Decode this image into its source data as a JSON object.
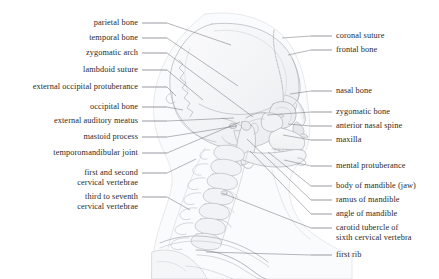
{
  "figure": {
    "background_color": "#ffffff",
    "text_color": "#2a2a2a",
    "leader_color": "#6e6e78",
    "art_stroke_color": "#b9bcc4",
    "art_fill_color": "#f4f5f7",
    "width": 439,
    "height": 279
  },
  "labels_left": [
    {
      "name": "parietal-bone",
      "lines": [
        "parietal bone"
      ],
      "text_right": 138,
      "baseline": 26,
      "dash_x1": 142,
      "dash_x2": 167,
      "lead_x": 231,
      "lead_y": 45
    },
    {
      "name": "temporal-bone",
      "lines": [
        "temporal bone"
      ],
      "text_right": 138,
      "baseline": 41,
      "dash_x1": 142,
      "dash_x2": 167,
      "lead_x": 238,
      "lead_y": 86
    },
    {
      "name": "zygomatic-arch",
      "lines": [
        "zygomatic arch"
      ],
      "text_right": 138,
      "baseline": 56,
      "dash_x1": 142,
      "dash_x2": 167,
      "lead_x": 253,
      "lead_y": 117
    },
    {
      "name": "lambdoid-suture",
      "lines": [
        "lambdoid suture"
      ],
      "text_right": 138,
      "baseline": 73,
      "dash_x1": 142,
      "dash_x2": 167,
      "lead_x": 203,
      "lead_y": 100
    },
    {
      "name": "external-occipital-protuberance",
      "lines": [
        "external occipital protuberance"
      ],
      "text_right": 138,
      "baseline": 90,
      "dash_x1": 142,
      "dash_x2": 167,
      "lead_x": 176,
      "lead_y": 96
    },
    {
      "name": "occipital-bone",
      "lines": [
        "occipital bone"
      ],
      "text_right": 138,
      "baseline": 110,
      "dash_x1": 142,
      "dash_x2": 167,
      "lead_x": 183,
      "lead_y": 110
    },
    {
      "name": "external-auditory-meatus",
      "lines": [
        "external auditory meatus"
      ],
      "text_right": 138,
      "baseline": 124,
      "dash_x1": 142,
      "dash_x2": 167,
      "lead_x": 234,
      "lead_y": 118
    },
    {
      "name": "mastoid-process",
      "lines": [
        "mastoid process"
      ],
      "text_right": 138,
      "baseline": 140,
      "dash_x1": 142,
      "dash_x2": 167,
      "lead_x": 236,
      "lead_y": 126
    },
    {
      "name": "temporomandibular-joint",
      "lines": [
        "temporomandibular joint"
      ],
      "text_right": 138,
      "baseline": 156,
      "dash_x1": 142,
      "dash_x2": 167,
      "lead_x": 240,
      "lead_y": 122
    },
    {
      "name": "first-and-second-cervical-vertebrae",
      "lines": [
        "first and second",
        "cervical vertebrae"
      ],
      "text_right": 138,
      "baseline": 176,
      "dash_x1": 142,
      "dash_x2": 167,
      "lead_x": 196,
      "lead_y": 159
    },
    {
      "name": "third-to-seventh-cervical-vertebrae",
      "lines": [
        "third to seventh",
        "cervical vertebrae"
      ],
      "text_right": 138,
      "baseline": 200,
      "dash_x1": 142,
      "dash_x2": 167,
      "lead_x": 190,
      "lead_y": 210
    }
  ],
  "labels_right": [
    {
      "name": "coronal-suture",
      "lines": [
        "coronal suture"
      ],
      "text_left": 336,
      "baseline": 39,
      "dash_x1": 311,
      "dash_x2": 332,
      "lead_x": 282,
      "lead_y": 38
    },
    {
      "name": "frontal-bone",
      "lines": [
        "frontal bone"
      ],
      "text_left": 336,
      "baseline": 53,
      "dash_x1": 311,
      "dash_x2": 332,
      "lead_x": 288,
      "lead_y": 55
    },
    {
      "name": "nasal-bone",
      "lines": [
        "nasal bone"
      ],
      "text_left": 336,
      "baseline": 94,
      "dash_x1": 311,
      "dash_x2": 332,
      "lead_x": 290,
      "lead_y": 94
    },
    {
      "name": "zygomatic-bone",
      "lines": [
        "zygomatic bone"
      ],
      "text_left": 336,
      "baseline": 115,
      "dash_x1": 311,
      "dash_x2": 332,
      "lead_x": 267,
      "lead_y": 115
    },
    {
      "name": "anterior-nasal-spine",
      "lines": [
        "anterior nasal spine"
      ],
      "text_left": 336,
      "baseline": 129,
      "dash_x1": 311,
      "dash_x2": 332,
      "lead_x": 288,
      "lead_y": 124
    },
    {
      "name": "maxilla",
      "lines": [
        "maxilla"
      ],
      "text_left": 336,
      "baseline": 143,
      "dash_x1": 311,
      "dash_x2": 332,
      "lead_x": 283,
      "lead_y": 135
    },
    {
      "name": "mental-protuberance",
      "lines": [
        "mental protuberance"
      ],
      "text_left": 336,
      "baseline": 169,
      "dash_x1": 311,
      "dash_x2": 332,
      "lead_x": 284,
      "lead_y": 160
    },
    {
      "name": "body-of-mandible-jaw",
      "lines": [
        "body of mandible (jaw)"
      ],
      "text_left": 336,
      "baseline": 189,
      "dash_x1": 311,
      "dash_x2": 332,
      "lead_x": 268,
      "lead_y": 152
    },
    {
      "name": "ramus-of-mandible",
      "lines": [
        "ramus of mandible"
      ],
      "text_left": 336,
      "baseline": 203,
      "dash_x1": 311,
      "dash_x2": 332,
      "lead_x": 247,
      "lead_y": 139
    },
    {
      "name": "angle-of-mandible",
      "lines": [
        "angle of mandible"
      ],
      "text_left": 336,
      "baseline": 217,
      "dash_x1": 311,
      "dash_x2": 332,
      "lead_x": 250,
      "lead_y": 151
    },
    {
      "name": "carotid-tubercle-of-sixth-cervical-vertebra",
      "lines": [
        "carotid tubercle of",
        "sixth cervical vertebra"
      ],
      "text_left": 336,
      "baseline": 231,
      "dash_x1": 311,
      "dash_x2": 332,
      "lead_x": 222,
      "lead_y": 193
    },
    {
      "name": "first-rib",
      "lines": [
        "first rib"
      ],
      "text_left": 336,
      "baseline": 258,
      "dash_x1": 311,
      "dash_x2": 332,
      "lead_x": 206,
      "lead_y": 252
    }
  ]
}
